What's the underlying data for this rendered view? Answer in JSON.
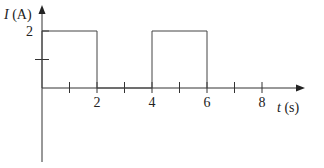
{
  "chart_data": {
    "type": "line",
    "title": "",
    "xlabel": "t (s)",
    "ylabel": "I (A)",
    "x_var": "t",
    "x_unit": "(s)",
    "y_var": "I",
    "y_unit": "(A)",
    "series": [
      {
        "name": "I(t)",
        "x": [
          0,
          0,
          2,
          2,
          4,
          4,
          6,
          6
        ],
        "values": [
          0,
          2,
          2,
          0,
          0,
          2,
          2,
          0
        ]
      }
    ],
    "xticks": [
      1,
      2,
      3,
      4,
      5,
      6,
      7,
      8
    ],
    "xtick_labels": [
      "2",
      "4",
      "6",
      "8"
    ],
    "xtick_label_values": [
      2,
      4,
      6,
      8
    ],
    "yticks": [
      1,
      2
    ],
    "ytick_labels": [
      "2"
    ],
    "xlim": [
      0,
      9.5
    ],
    "ylim": [
      -1.8,
      2.6
    ],
    "grid": false,
    "legend": null
  }
}
